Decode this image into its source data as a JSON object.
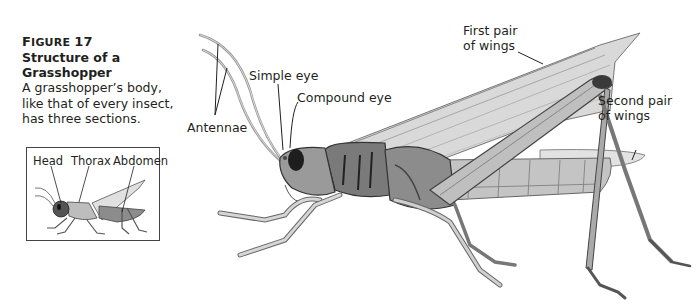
{
  "figure": {
    "number_prefix": "F",
    "number_rest": "IGURE",
    "number": "17",
    "title": "Structure of a Grasshopper",
    "description_lines": [
      "A grasshopper’s body,",
      "like that of every insect,",
      "has three sections."
    ]
  },
  "labels": {
    "antennae": "Antennae",
    "simple_eye": "Simple eye",
    "compound_eye": "Compound eye",
    "first_wings_line1": "First pair",
    "first_wings_line2": "of wings",
    "second_wings_line1": "Second pair",
    "second_wings_line2": "of wings"
  },
  "inset": {
    "labels": [
      "Head",
      "Thorax",
      "Abdomen"
    ]
  },
  "colors": {
    "text": "#231f20",
    "body_dark": "#3a3a3a",
    "body_mid": "#8a8a8a",
    "body_light": "#c8c8c8",
    "inset_head": "#555555",
    "inset_thorax": "#bdbdbd",
    "inset_abdomen": "#8c8c8c"
  }
}
